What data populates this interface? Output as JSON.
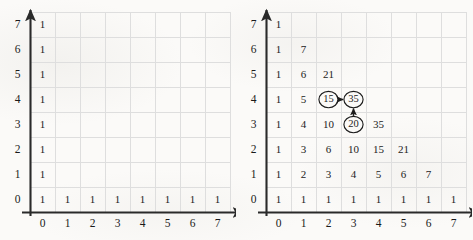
{
  "figure": {
    "background_color": "#fbfaf8",
    "ink_color": "#1c1c1c",
    "gridline_color": "#dedede",
    "axis_color": "#2a2a2a"
  },
  "panels": [
    {
      "id": "left",
      "name": "empty-grid",
      "axis": {
        "x_labels": [
          "0",
          "1",
          "2",
          "3",
          "4",
          "5",
          "6",
          "7"
        ],
        "y_labels": [
          "0",
          "1",
          "2",
          "3",
          "4",
          "5",
          "6",
          "7"
        ],
        "x_arrow": true,
        "y_arrow": true
      },
      "cells": [
        {
          "x": 0,
          "y": 0,
          "value": "1"
        },
        {
          "x": 1,
          "y": 0,
          "value": "1"
        },
        {
          "x": 2,
          "y": 0,
          "value": "1"
        },
        {
          "x": 3,
          "y": 0,
          "value": "1"
        },
        {
          "x": 4,
          "y": 0,
          "value": "1"
        },
        {
          "x": 5,
          "y": 0,
          "value": "1"
        },
        {
          "x": 6,
          "y": 0,
          "value": "1"
        },
        {
          "x": 7,
          "y": 0,
          "value": "1"
        },
        {
          "x": 0,
          "y": 1,
          "value": "1"
        },
        {
          "x": 0,
          "y": 2,
          "value": "1"
        },
        {
          "x": 0,
          "y": 3,
          "value": "1"
        },
        {
          "x": 0,
          "y": 4,
          "value": "1"
        },
        {
          "x": 0,
          "y": 5,
          "value": "1"
        },
        {
          "x": 0,
          "y": 6,
          "value": "1"
        },
        {
          "x": 0,
          "y": 7,
          "value": "1"
        }
      ],
      "annotations": []
    },
    {
      "id": "right",
      "name": "filled-grid",
      "axis": {
        "x_labels": [
          "0",
          "1",
          "2",
          "3",
          "4",
          "5",
          "6",
          "7"
        ],
        "y_labels": [
          "0",
          "1",
          "2",
          "3",
          "4",
          "5",
          "6",
          "7"
        ],
        "x_arrow": true,
        "y_arrow": true
      },
      "cells": [
        {
          "x": 0,
          "y": 0,
          "value": "1"
        },
        {
          "x": 1,
          "y": 0,
          "value": "1"
        },
        {
          "x": 2,
          "y": 0,
          "value": "1"
        },
        {
          "x": 3,
          "y": 0,
          "value": "1"
        },
        {
          "x": 4,
          "y": 0,
          "value": "1"
        },
        {
          "x": 5,
          "y": 0,
          "value": "1"
        },
        {
          "x": 6,
          "y": 0,
          "value": "1"
        },
        {
          "x": 7,
          "y": 0,
          "value": "1"
        },
        {
          "x": 0,
          "y": 1,
          "value": "1"
        },
        {
          "x": 1,
          "y": 1,
          "value": "2"
        },
        {
          "x": 2,
          "y": 1,
          "value": "3"
        },
        {
          "x": 3,
          "y": 1,
          "value": "4"
        },
        {
          "x": 4,
          "y": 1,
          "value": "5"
        },
        {
          "x": 5,
          "y": 1,
          "value": "6"
        },
        {
          "x": 6,
          "y": 1,
          "value": "7"
        },
        {
          "x": 0,
          "y": 2,
          "value": "1"
        },
        {
          "x": 1,
          "y": 2,
          "value": "3"
        },
        {
          "x": 2,
          "y": 2,
          "value": "6"
        },
        {
          "x": 3,
          "y": 2,
          "value": "10"
        },
        {
          "x": 4,
          "y": 2,
          "value": "15"
        },
        {
          "x": 5,
          "y": 2,
          "value": "21"
        },
        {
          "x": 0,
          "y": 3,
          "value": "1"
        },
        {
          "x": 1,
          "y": 3,
          "value": "4"
        },
        {
          "x": 2,
          "y": 3,
          "value": "10"
        },
        {
          "x": 3,
          "y": 3,
          "value": "20",
          "circled": true
        },
        {
          "x": 4,
          "y": 3,
          "value": "35"
        },
        {
          "x": 0,
          "y": 4,
          "value": "1"
        },
        {
          "x": 1,
          "y": 4,
          "value": "5"
        },
        {
          "x": 2,
          "y": 4,
          "value": "15",
          "circled": true
        },
        {
          "x": 3,
          "y": 4,
          "value": "35",
          "circled": true
        },
        {
          "x": 0,
          "y": 5,
          "value": "1"
        },
        {
          "x": 1,
          "y": 5,
          "value": "6"
        },
        {
          "x": 2,
          "y": 5,
          "value": "21"
        },
        {
          "x": 0,
          "y": 6,
          "value": "1"
        },
        {
          "x": 1,
          "y": 6,
          "value": "7"
        },
        {
          "x": 0,
          "y": 7,
          "value": "1"
        }
      ],
      "annotations": [
        {
          "name": "arrow-15-to-35",
          "from": {
            "x": 2,
            "y": 4
          },
          "to": {
            "x": 3,
            "y": 4
          },
          "direction": "right"
        },
        {
          "name": "arrow-20-to-35",
          "from": {
            "x": 3,
            "y": 3
          },
          "to": {
            "x": 3,
            "y": 4
          },
          "direction": "up"
        }
      ]
    }
  ]
}
